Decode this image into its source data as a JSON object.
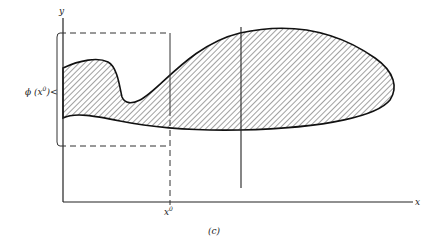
{
  "figure": {
    "caption": "(c)",
    "axes": {
      "x_label": "x",
      "y_label": "y"
    },
    "annotations": {
      "x0_label": "x",
      "x0_superscript": "0",
      "phi_label": "ϕ (x",
      "phi_superscript": "0",
      "phi_close": ")",
      "bracket_symbol": "<"
    },
    "elements": {
      "region": "shaded region (hatched)",
      "vertical_section_line": "vertical line through region",
      "dashed_projection": "dashed projection at x0"
    }
  }
}
